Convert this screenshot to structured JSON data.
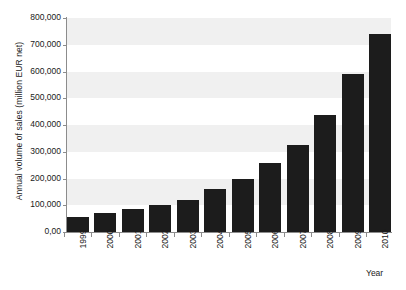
{
  "chart_data": {
    "type": "bar",
    "title": "",
    "subtitle": "",
    "xlabel": "Year",
    "ylabel": "Annual volume of sales (million EUR net)",
    "categories": [
      "1999",
      "2000",
      "2001",
      "2002",
      "2003",
      "2004",
      "2005",
      "2006",
      "2007",
      "2008",
      "2009",
      "2010"
    ],
    "values": [
      55000,
      72000,
      85000,
      100000,
      118000,
      160000,
      200000,
      258000,
      325000,
      437000,
      590000,
      740000
    ],
    "ylim": [
      0,
      800000
    ],
    "ytick_values": [
      0,
      100000,
      200000,
      300000,
      400000,
      500000,
      600000,
      700000,
      800000
    ],
    "ytick_labels": [
      "0,00",
      "100,000",
      "200,000",
      "300,000",
      "400,000",
      "500,000",
      "600,000",
      "700,000",
      "800,000"
    ],
    "grid": false,
    "banded_background": true,
    "legend": null,
    "legend_position": "none",
    "bar_color": "#1c1c1c",
    "band_color": "#f0f0f0",
    "axis_color": "#8c8c8c"
  }
}
